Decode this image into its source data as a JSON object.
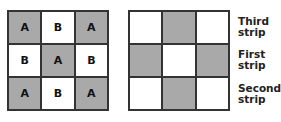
{
  "left_grid": {
    "rows": [
      [
        {
          "label": "A",
          "shaded": true
        },
        {
          "label": "B",
          "shaded": false
        },
        {
          "label": "A",
          "shaded": true
        }
      ],
      [
        {
          "label": "B",
          "shaded": false
        },
        {
          "label": "A",
          "shaded": true
        },
        {
          "label": "B",
          "shaded": false
        }
      ],
      [
        {
          "label": "A",
          "shaded": true
        },
        {
          "label": "B",
          "shaded": false
        },
        {
          "label": "A",
          "shaded": true
        }
      ]
    ]
  },
  "right_grid": {
    "rows": [
      [
        {
          "shaded": false
        },
        {
          "shaded": true
        },
        {
          "shaded": false
        }
      ],
      [
        {
          "shaded": true
        },
        {
          "shaded": false
        },
        {
          "shaded": true
        }
      ],
      [
        {
          "shaded": false
        },
        {
          "shaded": true
        },
        {
          "shaded": false
        }
      ]
    ]
  },
  "strip_labels": [
    {
      "line1": "Third",
      "line2": "strip"
    },
    {
      "line1": "First",
      "line2": "strip"
    },
    {
      "line1": "Second",
      "line2": "strip"
    }
  ],
  "colors": {
    "shade": "#a9a9a9",
    "border": "#333333"
  }
}
